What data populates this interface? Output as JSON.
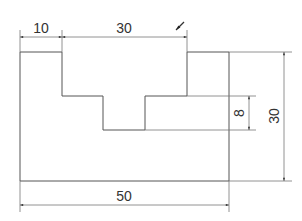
{
  "drawing": {
    "type": "stepped-part-front-view",
    "dimensions": {
      "left_step_width": "10",
      "top_opening_width": "30",
      "total_width": "50",
      "total_height": "30",
      "notch_depth": "8"
    },
    "indicator": "view-direction-arrow",
    "colors": {
      "line": "#555555",
      "dimension": "#777777",
      "text": "#333333",
      "background": "#ffffff"
    }
  }
}
